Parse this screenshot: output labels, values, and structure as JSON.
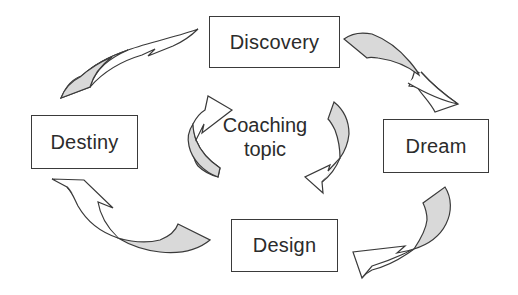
{
  "diagram": {
    "type": "cycle",
    "center": {
      "line1": "Coaching",
      "line2": "topic"
    },
    "stages": [
      {
        "id": "discovery",
        "label": "Discovery"
      },
      {
        "id": "dream",
        "label": "Dream"
      },
      {
        "id": "design",
        "label": "Design"
      },
      {
        "id": "destiny",
        "label": "Destiny"
      }
    ],
    "flow": [
      {
        "from": "Discovery",
        "to": "Dream"
      },
      {
        "from": "Dream",
        "to": "Design"
      },
      {
        "from": "Design",
        "to": "Destiny"
      },
      {
        "from": "Destiny",
        "to": "Discovery"
      }
    ],
    "inner_arrows": 2,
    "colors": {
      "stroke": "#3a3a3a",
      "arrow_shade": "#d9d9d9",
      "text": "#2b2b2b",
      "background": "#ffffff"
    }
  }
}
